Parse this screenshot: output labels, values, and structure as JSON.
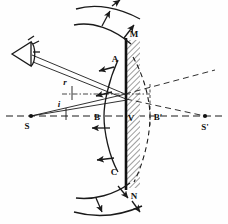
{
  "figure": {
    "background": "#fefefe",
    "ink": "#1a1a1a",
    "hatch_color": "#555555",
    "width": 228,
    "height": 224
  },
  "labels": {
    "source": "S",
    "image": "S'",
    "wavefront_left": "B",
    "wavefront_right": "B'",
    "vertex": "V",
    "upper_edge": "A",
    "lower_edge": "C",
    "mirror_top": "M",
    "mirror_bottom": "N",
    "angle_reflection": "r",
    "angle_incidence": "i"
  },
  "elements": {
    "eye": "eye-symbol",
    "mirror": "plane-mirror-hatched",
    "axis": "optical-axis-dashed",
    "incident_wavefront": "incident-spherical-wavefront",
    "reflected_wavefront": "reflected-spherical-wavefront",
    "ray_arrows": "propagation-direction-arrows"
  },
  "geometry": {
    "mirror_x": 126,
    "mirror_top_y": 40,
    "mirror_bottom_y": 188,
    "axis_y": 116,
    "source_x": 31,
    "image_x": 205,
    "vertex_x": 126,
    "point_A": [
      118,
      60
    ],
    "point_C": [
      118,
      172
    ],
    "reflection_point": [
      125,
      94
    ]
  }
}
